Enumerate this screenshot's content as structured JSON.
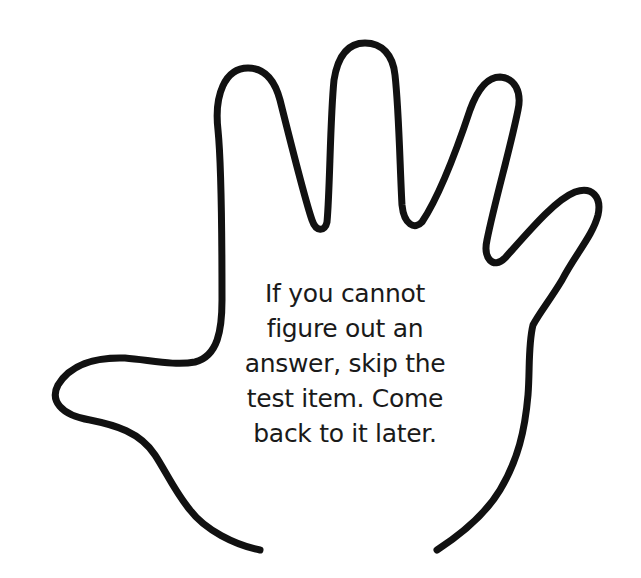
{
  "figure": {
    "shape": "hand-outline",
    "stroke_color": "#111111",
    "background_color": "#ffffff"
  },
  "tip": {
    "lines": [
      "If you cannot",
      "figure out an",
      "answer, skip the",
      "test item. Come",
      "back to it later."
    ]
  }
}
